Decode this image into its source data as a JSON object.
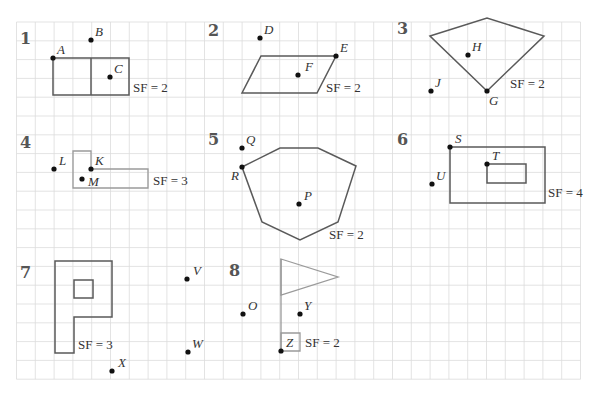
{
  "grid": {
    "x0": 16.5,
    "y0": 22,
    "spacing": 18.8,
    "cols": 30,
    "rows": 19,
    "line_color": "#dcdcdc"
  },
  "questions": [
    {
      "number": "1",
      "number_pos": [
        20,
        44
      ],
      "style": "dark",
      "polygons": [
        [
          [
            53,
            58
          ],
          [
            129,
            58
          ],
          [
            129,
            95
          ],
          [
            53,
            95
          ]
        ]
      ],
      "segments": [
        [
          [
            91,
            58
          ],
          [
            91,
            95
          ]
        ]
      ],
      "points": [
        {
          "label": "A",
          "x": 53,
          "y": 58,
          "lx": 57,
          "ly": 54
        },
        {
          "label": "B",
          "x": 91,
          "y": 40,
          "lx": 95,
          "ly": 36
        },
        {
          "label": "C",
          "x": 110,
          "y": 77,
          "lx": 114,
          "ly": 73
        }
      ],
      "scale_factor": {
        "text": "SF = 2",
        "x": 133,
        "y": 92
      }
    },
    {
      "number": "2",
      "number_pos": [
        208,
        36
      ],
      "style": "dark",
      "polygons": [
        [
          [
            261,
            56
          ],
          [
            336,
            56
          ],
          [
            317,
            93
          ],
          [
            242,
            93
          ]
        ]
      ],
      "segments": [],
      "points": [
        {
          "label": "D",
          "x": 260,
          "y": 38,
          "lx": 264,
          "ly": 34
        },
        {
          "label": "E",
          "x": 336,
          "y": 56,
          "lx": 340,
          "ly": 52
        },
        {
          "label": "F",
          "x": 298,
          "y": 75,
          "lx": 305,
          "ly": 71
        }
      ],
      "scale_factor": {
        "text": "SF = 2",
        "x": 326,
        "y": 92
      }
    },
    {
      "number": "3",
      "number_pos": [
        397,
        34
      ],
      "style": "dark",
      "polygons": [
        [
          [
            430,
            36
          ],
          [
            487,
            18
          ],
          [
            544,
            36
          ],
          [
            487,
            91
          ]
        ]
      ],
      "segments": [],
      "points": [
        {
          "label": "H",
          "x": 468,
          "y": 55,
          "lx": 472,
          "ly": 51
        },
        {
          "label": "J",
          "x": 431,
          "y": 91,
          "lx": 435,
          "ly": 87
        },
        {
          "label": "G",
          "x": 487,
          "y": 91,
          "lx": 489,
          "ly": 105
        }
      ],
      "scale_factor": {
        "text": "SF = 2",
        "x": 510,
        "y": 88
      }
    },
    {
      "number": "4",
      "number_pos": [
        20,
        148
      ],
      "style": "light",
      "polygons": [
        [
          [
            73,
            151
          ],
          [
            91,
            151
          ],
          [
            91,
            169
          ],
          [
            148,
            169
          ],
          [
            148,
            188
          ],
          [
            73,
            188
          ]
        ]
      ],
      "segments": [],
      "points": [
        {
          "label": "L",
          "x": 54,
          "y": 169,
          "lx": 59,
          "ly": 165
        },
        {
          "label": "K",
          "x": 91,
          "y": 169,
          "lx": 95,
          "ly": 165
        },
        {
          "label": "M",
          "x": 82,
          "y": 179,
          "lx": 88,
          "ly": 186
        }
      ],
      "scale_factor": {
        "text": "SF = 3",
        "x": 153,
        "y": 185
      }
    },
    {
      "number": "5",
      "number_pos": [
        208,
        145
      ],
      "style": "dark",
      "polygons": [
        [
          [
            242,
            167
          ],
          [
            280,
            148
          ],
          [
            318,
            148
          ],
          [
            356,
            166
          ],
          [
            338,
            222
          ],
          [
            300,
            240
          ],
          [
            262,
            222
          ]
        ]
      ],
      "segments": [],
      "points": [
        {
          "label": "Q",
          "x": 242,
          "y": 148,
          "lx": 246,
          "ly": 144
        },
        {
          "label": "R",
          "x": 242,
          "y": 167,
          "lx": 231,
          "ly": 180
        },
        {
          "label": "P",
          "x": 299,
          "y": 204,
          "lx": 304,
          "ly": 200
        }
      ],
      "scale_factor": {
        "text": "SF = 2",
        "x": 329,
        "y": 239
      }
    },
    {
      "number": "6",
      "number_pos": [
        397,
        145
      ],
      "style": "dark",
      "polygons": [
        [
          [
            450,
            147
          ],
          [
            545,
            147
          ],
          [
            545,
            203
          ],
          [
            450,
            203
          ]
        ],
        [
          [
            487,
            164
          ],
          [
            526,
            164
          ],
          [
            526,
            183
          ],
          [
            487,
            183
          ]
        ]
      ],
      "segments": [],
      "points": [
        {
          "label": "S",
          "x": 450,
          "y": 147,
          "lx": 455,
          "ly": 143
        },
        {
          "label": "T",
          "x": 487,
          "y": 164,
          "lx": 492,
          "ly": 160
        },
        {
          "label": "U",
          "x": 432,
          "y": 184,
          "lx": 436,
          "ly": 180
        }
      ],
      "scale_factor": {
        "text": "SF = 4",
        "x": 548,
        "y": 197
      }
    },
    {
      "number": "7",
      "number_pos": [
        20,
        278
      ],
      "style": "dark",
      "polygons": [
        [
          [
            55,
            261
          ],
          [
            112,
            261
          ],
          [
            112,
            317
          ],
          [
            74,
            317
          ],
          [
            74,
            353
          ],
          [
            55,
            353
          ]
        ],
        [
          [
            74,
            280
          ],
          [
            93,
            280
          ],
          [
            93,
            298
          ],
          [
            74,
            298
          ]
        ]
      ],
      "segments": [],
      "points": [
        {
          "label": "V",
          "x": 187,
          "y": 279,
          "lx": 193,
          "ly": 275
        },
        {
          "label": "W",
          "x": 188,
          "y": 352,
          "lx": 192,
          "ly": 348
        },
        {
          "label": "X",
          "x": 112,
          "y": 371,
          "lx": 118,
          "ly": 367
        }
      ],
      "scale_factor": {
        "text": "SF = 3",
        "x": 78,
        "y": 349
      }
    },
    {
      "number": "8",
      "number_pos": [
        229,
        276
      ],
      "style": "light",
      "polygons": [
        [
          [
            281,
            259
          ],
          [
            338,
            277
          ],
          [
            281,
            295
          ]
        ],
        [
          [
            281,
            333
          ],
          [
            300,
            333
          ],
          [
            300,
            351
          ],
          [
            281,
            351
          ]
        ]
      ],
      "segments": [
        [
          [
            281,
            259
          ],
          [
            281,
            351
          ]
        ]
      ],
      "points": [
        {
          "label": "O",
          "x": 243,
          "y": 314,
          "lx": 248,
          "ly": 310
        },
        {
          "label": "Y",
          "x": 300,
          "y": 314,
          "lx": 304,
          "ly": 310
        },
        {
          "label": "Z",
          "x": 281,
          "y": 351,
          "lx": 286,
          "ly": 347
        }
      ],
      "scale_factor": {
        "text": "SF = 2",
        "x": 305,
        "y": 347
      }
    }
  ]
}
